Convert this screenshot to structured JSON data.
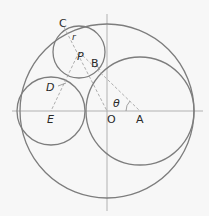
{
  "diagram": {
    "title": "",
    "colors": {
      "background": "#f7f7f7",
      "circle_stroke": "#7d7d7d",
      "axis_stroke": "#a8a8a8",
      "dashed_stroke": "#9a9a9a",
      "label": "#2a2a2a"
    },
    "labels": {
      "C": "C",
      "r": "r",
      "P": "P",
      "B": "B",
      "D": "D",
      "theta": "θ",
      "E": "E",
      "O": "O",
      "A": "A"
    },
    "circles": [
      {
        "name": "outer-circle-O",
        "cx": 107,
        "cy": 111,
        "r": 87
      },
      {
        "name": "right-circle-A",
        "cx": 140,
        "cy": 111,
        "r": 54
      },
      {
        "name": "left-circle-E",
        "cx": 51,
        "cy": 111,
        "r": 34
      },
      {
        "name": "small-circle-P",
        "cx": 79,
        "cy": 52,
        "r": 26
      }
    ],
    "points": {
      "C": [
        64,
        27
      ],
      "P": [
        79,
        52
      ],
      "B": [
        99,
        66
      ],
      "D": [
        63,
        86
      ],
      "E": [
        51,
        111
      ],
      "O": [
        107,
        111
      ],
      "A": [
        140,
        111
      ]
    },
    "axes": {
      "horizontal": {
        "x1": 12,
        "y": 111,
        "x2": 203
      },
      "vertical": {
        "x": 107,
        "y1": 14,
        "y2": 211
      }
    }
  }
}
